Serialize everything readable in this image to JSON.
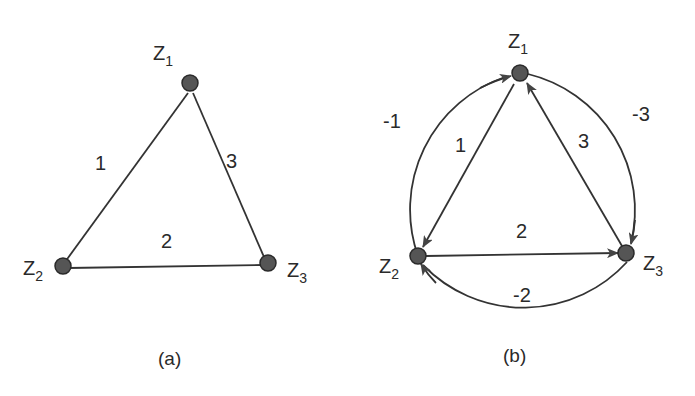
{
  "diagram_a": {
    "caption": "(a)",
    "nodes": [
      {
        "id": "Z1",
        "label": "Z",
        "sub": "1"
      },
      {
        "id": "Z2",
        "label": "Z",
        "sub": "2"
      },
      {
        "id": "Z3",
        "label": "Z",
        "sub": "3"
      }
    ],
    "edges": [
      {
        "from": "Z1",
        "to": "Z2",
        "label": "1",
        "directed": false
      },
      {
        "from": "Z2",
        "to": "Z3",
        "label": "2",
        "directed": false
      },
      {
        "from": "Z3",
        "to": "Z1",
        "label": "3",
        "directed": false
      }
    ]
  },
  "diagram_b": {
    "caption": "(b)",
    "nodes": [
      {
        "id": "Z1",
        "label": "Z",
        "sub": "1"
      },
      {
        "id": "Z2",
        "label": "Z",
        "sub": "2"
      },
      {
        "id": "Z3",
        "label": "Z",
        "sub": "3"
      }
    ],
    "edges": [
      {
        "from": "Z1",
        "to": "Z2",
        "label": "1",
        "directed": true,
        "style": "straight"
      },
      {
        "from": "Z2",
        "to": "Z3",
        "label": "2",
        "directed": true,
        "style": "straight"
      },
      {
        "from": "Z3",
        "to": "Z1",
        "label": "3",
        "directed": true,
        "style": "straight"
      },
      {
        "from": "Z2",
        "to": "Z1",
        "label": "-1",
        "directed": true,
        "style": "arc"
      },
      {
        "from": "Z3",
        "to": "Z2",
        "label": "-2",
        "directed": true,
        "style": "arc"
      },
      {
        "from": "Z1",
        "to": "Z3",
        "label": "-3",
        "directed": true,
        "style": "arc"
      }
    ]
  },
  "colors": {
    "stroke": "#333333",
    "node_fill": "#555555",
    "text": "#2a2a2a"
  }
}
